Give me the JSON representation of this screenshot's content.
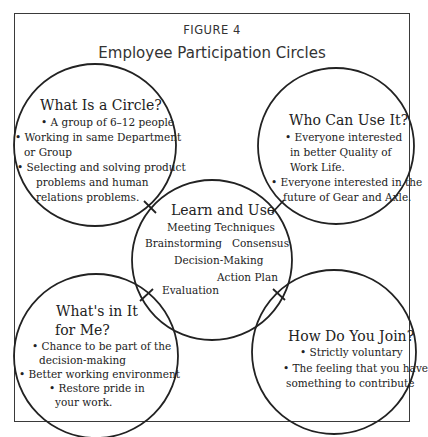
{
  "figure": {
    "label": "FIGURE 4",
    "title": "Employee Participation Circles"
  },
  "circles": {
    "what_is": {
      "heading": "What Is a Circle?",
      "lines": [
        "• A group of 6–12 people",
        "• Working in same Department",
        "or Group",
        "• Selecting and solving product",
        "problems and human",
        "relations problems."
      ]
    },
    "who_can": {
      "heading": "Who Can Use It?",
      "lines": [
        "• Everyone interested",
        "in better Quality of",
        "Work Life.",
        "• Everyone interested in the",
        "future of Gear and Axle."
      ]
    },
    "learn_use": {
      "heading": "Learn and Use",
      "items": [
        "Meeting Techniques",
        "Brainstorming",
        "Consensus",
        "Decision-Making",
        "Action Plan",
        "Evaluation"
      ]
    },
    "whats_in": {
      "heading_line1": "What's in It",
      "heading_line2": "for Me?",
      "lines": [
        "• Chance to be part of the",
        "decision-making",
        "• Better working environment",
        "• Restore pride in",
        "your work."
      ]
    },
    "how_join": {
      "heading": "How Do You Join?",
      "lines": [
        "• Strictly voluntary",
        "• The feeling that you have",
        "something to contribute"
      ]
    }
  },
  "colors": {
    "stroke": "#222222",
    "text": "#222222",
    "background": "#ffffff"
  }
}
